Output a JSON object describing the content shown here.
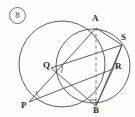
{
  "figure": {
    "problem_number": "8",
    "canvas": {
      "width": 135,
      "height": 117
    },
    "colors": {
      "stroke": "#4a4a4a",
      "dashed_stroke": "#6a6a6a",
      "label": "#2b2b2b",
      "background": "#fdfdfd"
    },
    "circles": [
      {
        "name": "large-left-circle",
        "cx": 62,
        "cy": 64,
        "r": 43
      },
      {
        "name": "small-right-circle",
        "cx": 93,
        "cy": 66,
        "r": 37
      }
    ],
    "points": [
      {
        "id": "A",
        "label": "A",
        "x": 96,
        "y": 28,
        "label_x": 92,
        "label_y": 14
      },
      {
        "id": "S",
        "label": "S",
        "x": 122,
        "y": 45,
        "label_x": 121,
        "label_y": 33
      },
      {
        "id": "R",
        "label": "R",
        "x": 113,
        "y": 69,
        "label_x": 114,
        "label_y": 62
      },
      {
        "id": "Q",
        "label": "Q",
        "x": 51,
        "y": 68,
        "label_x": 43,
        "label_y": 61
      },
      {
        "id": "P",
        "label": "P",
        "x": 29,
        "y": 102,
        "label_x": 22,
        "label_y": 101
      },
      {
        "id": "B",
        "label": "B",
        "x": 96,
        "y": 106,
        "label_x": 93,
        "label_y": 106
      }
    ],
    "segments": [
      {
        "name": "segment-P-A",
        "from": "P",
        "to": "A"
      },
      {
        "name": "segment-P-R",
        "from": "P",
        "to": "R"
      },
      {
        "name": "segment-Q-S",
        "from": "Q",
        "to": "S"
      },
      {
        "name": "segment-Q-B",
        "from": "Q",
        "to": "B"
      },
      {
        "name": "segment-S-R",
        "from": "S",
        "to": "R"
      },
      {
        "name": "segment-S-B",
        "from": "S",
        "to": "B"
      },
      {
        "name": "segment-R-B",
        "from": "R",
        "to": "B"
      },
      {
        "name": "segment-A-S",
        "from": "A",
        "to": "S"
      }
    ],
    "dashed_segments": [
      {
        "name": "dashed-segment-A-B",
        "from": "A",
        "to": "B"
      }
    ],
    "markers": [
      {
        "name": "angle-arc-at-P",
        "type": "angle-arc"
      },
      {
        "name": "angle-arc-at-Q",
        "type": "angle-arc"
      },
      {
        "name": "right-angle-at-B",
        "type": "right-angle-square"
      }
    ]
  }
}
